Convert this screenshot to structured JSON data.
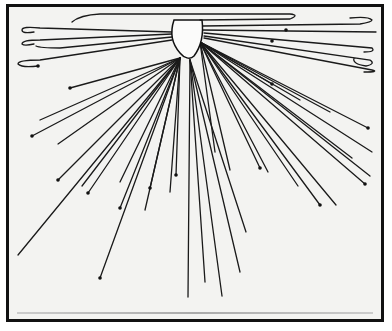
{
  "image": {
    "description": "Printed figure showing many thin tracks radiating outward from a central rounded body, several ending in small dots or hooked curls, framed by a black border",
    "colors": {
      "background": "#f3f3f1",
      "ink": "#1a1a1a",
      "frame": "#111111"
    },
    "track_count_approx": 40,
    "has_text": false
  }
}
